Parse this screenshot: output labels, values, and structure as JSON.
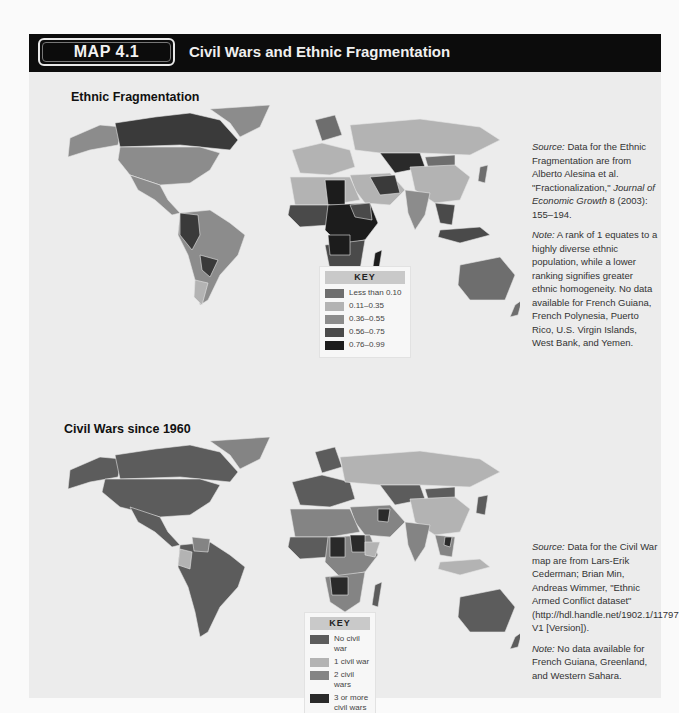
{
  "header": {
    "badge": "MAP 4.1",
    "title": "Civil Wars and Ethnic Fragmentation"
  },
  "maps": [
    {
      "title": "Ethnic Fragmentation",
      "key": {
        "heading": "KEY",
        "items": [
          {
            "label": "Less than 0.10",
            "color": "#6e6e6e"
          },
          {
            "label": "0.11–0.35",
            "color": "#b3b3b3"
          },
          {
            "label": "0.36–0.55",
            "color": "#8c8c8c"
          },
          {
            "label": "0.56–0.75",
            "color": "#4a4a4a"
          },
          {
            "label": "0.76–0.99",
            "color": "#1c1c1c"
          }
        ]
      },
      "source_label": "Source:",
      "source_text": " Data for the Ethnic Fragmentation are from Alberto Alesina et al. \"Fractionalization,\" ",
      "source_journal": "Journal of Economic Growth",
      "source_tail": " 8 (2003): 155–194.",
      "note_label": "Note:",
      "note_text": " A rank of 1 equates to a highly diverse ethnic population, while a lower ranking signifies greater ethnic homogeneity. No data available for French Guiana, French Polynesia, Puerto Rico, U.S. Virgin Islands, West Bank, and Yemen."
    },
    {
      "title": "Civil Wars since 1960",
      "key": {
        "heading": "KEY",
        "items": [
          {
            "label": "No civil war",
            "color": "#5c5c5c"
          },
          {
            "label": "1 civil war",
            "color": "#b3b3b3"
          },
          {
            "label": "2 civil wars",
            "color": "#848484"
          },
          {
            "label": "3 or more civil wars",
            "color": "#2a2a2a"
          }
        ]
      },
      "source_label": "Source:",
      "source_text": " Data for the Civil War map are from Lars-Erik Cederman; Brian Min, Andreas Wimmer, \"Ethnic Armed Conflict dataset\" (http://hdl.handle.net/1902.1/11797 V1 [Version]).",
      "note_label": "Note:",
      "note_text": " No data available for French Guiana, Greenland, and Western Sahara."
    }
  ]
}
